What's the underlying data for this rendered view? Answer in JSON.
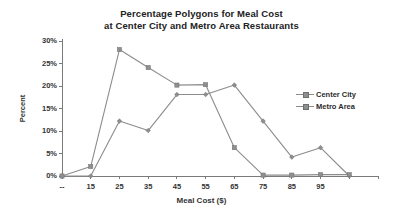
{
  "chart_data": {
    "type": "line",
    "title": "Percentage Polygons for Meal Cost at Center City and Metro Area Restaurants",
    "title_line1": "Percentage Polygons for Meal Cost",
    "title_line2": "at Center City and Metro Area Restaurants",
    "xlabel": "Meal Cost ($)",
    "ylabel": "Percent",
    "grid": false,
    "legend_position": "right",
    "xlim": [
      5,
      115
    ],
    "ylim": [
      0,
      30
    ],
    "ytick_values": [
      0,
      5,
      10,
      15,
      20,
      25,
      30
    ],
    "ytick_labels": [
      "0%",
      "5%",
      "10%",
      "15%",
      "20%",
      "25%",
      "30%"
    ],
    "xtick_values": [
      5,
      15,
      25,
      35,
      45,
      55,
      65,
      75,
      85,
      95,
      105,
      115
    ],
    "xtick_labels": [
      "--",
      "15",
      "25",
      "35",
      "45",
      "55",
      "65",
      "75",
      "85",
      "95",
      "",
      ""
    ],
    "x": [
      5,
      15,
      25,
      35,
      45,
      55,
      65,
      75,
      85,
      95,
      105
    ],
    "series": [
      {
        "name": "Center City",
        "marker": "diamond",
        "color": "#8c8c8c",
        "values": [
          0,
          0,
          12.2,
          10.1,
          18.1,
          18.1,
          20.2,
          12.2,
          4.2,
          6.3,
          0
        ]
      },
      {
        "name": "Metro Area",
        "marker": "square",
        "color": "#8c8c8c",
        "values": [
          0,
          2.1,
          28.1,
          24.1,
          20.2,
          20.3,
          6.3,
          0.2,
          0.2,
          0.3,
          0.3
        ]
      }
    ]
  },
  "legend": {
    "items": [
      {
        "label": "Center City"
      },
      {
        "label": "Metro Area"
      }
    ]
  }
}
